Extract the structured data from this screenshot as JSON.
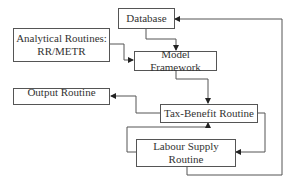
{
  "diagram": {
    "type": "flowchart",
    "nodes": {
      "database": {
        "label": "Database"
      },
      "analytical": {
        "label": "Analytical Routines: RR/METR",
        "line1": "Analytical Routines:",
        "line2": "RR/METR"
      },
      "model_framework": {
        "label": "Model Framework"
      },
      "output": {
        "label": "Output Routine"
      },
      "tax_benefit": {
        "label": "Tax-Benefit Routine"
      },
      "labour_supply": {
        "label": "Labour Supply Routine",
        "line1": "Labour Supply",
        "line2": "Routine"
      }
    },
    "edges": [
      {
        "from": "Database",
        "to": "Model Framework"
      },
      {
        "from": "Analytical Routines: RR/METR",
        "to": "Model Framework"
      },
      {
        "from": "Model Framework",
        "to": "Tax-Benefit Routine"
      },
      {
        "from": "Tax-Benefit Routine",
        "to": "Output Routine"
      },
      {
        "from": "Tax-Benefit Routine",
        "to": "Labour Supply Routine"
      },
      {
        "from": "Labour Supply Routine",
        "to": "Tax-Benefit Routine"
      },
      {
        "from": "Labour Supply Routine",
        "to": "Database"
      }
    ],
    "colors": {
      "line": "#444444",
      "box_border": "#555555",
      "text": "#333333",
      "background": "#ffffff"
    }
  }
}
